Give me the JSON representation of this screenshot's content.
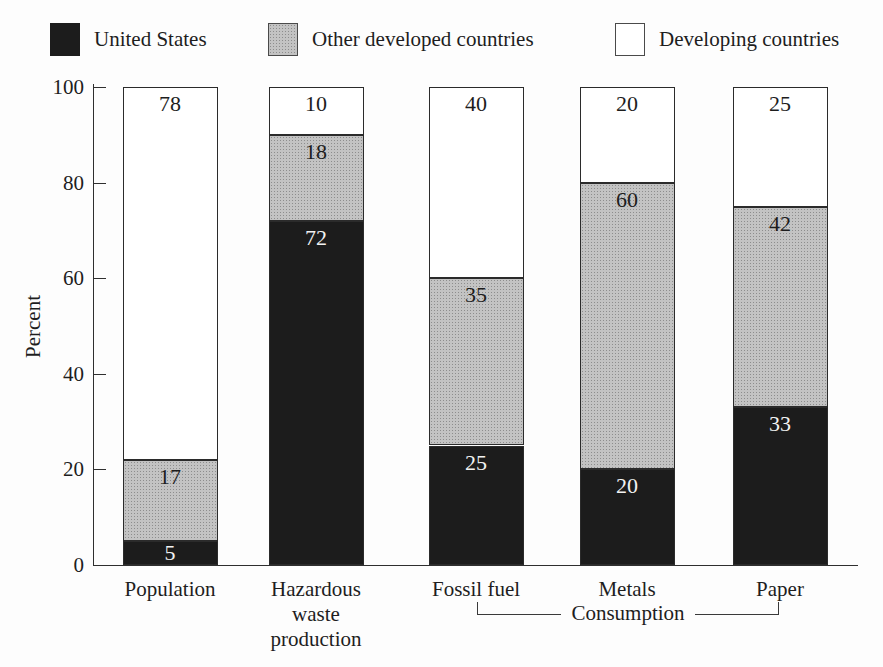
{
  "legend": {
    "items": [
      {
        "label": "United States",
        "fill": "us"
      },
      {
        "label": "Other developed countries",
        "fill": "other"
      },
      {
        "label": "Developing countries",
        "fill": "dev"
      }
    ]
  },
  "chart_data": {
    "type": "bar",
    "stacked": true,
    "title": "",
    "ylabel": "Percent",
    "ylim": [
      0,
      100
    ],
    "yticks": [
      0,
      20,
      40,
      60,
      80,
      100
    ],
    "grid": false,
    "legend_position": "top",
    "categories": [
      "Population",
      "Hazardous waste production",
      "Fossil fuel",
      "Metals",
      "Paper"
    ],
    "series": [
      {
        "name": "United States",
        "fill": "us",
        "color": "#1c1c1c",
        "values": [
          5,
          72,
          25,
          20,
          33
        ]
      },
      {
        "name": "Other developed countries",
        "fill": "other",
        "color": "#b7b7b7",
        "values": [
          17,
          18,
          35,
          60,
          42
        ]
      },
      {
        "name": "Developing countries",
        "fill": "dev",
        "color": "#ffffff",
        "values": [
          78,
          10,
          40,
          20,
          25
        ]
      }
    ],
    "group_annotation": {
      "label": "Consumption",
      "from_category": "Fossil fuel",
      "to_category": "Paper"
    }
  },
  "colors": {
    "bar_black": "#1c1c1c",
    "bar_gray": "#b7b7b7",
    "bar_white": "#ffffff",
    "axis": "#2f2f2f",
    "text": "#1e1e1e"
  }
}
